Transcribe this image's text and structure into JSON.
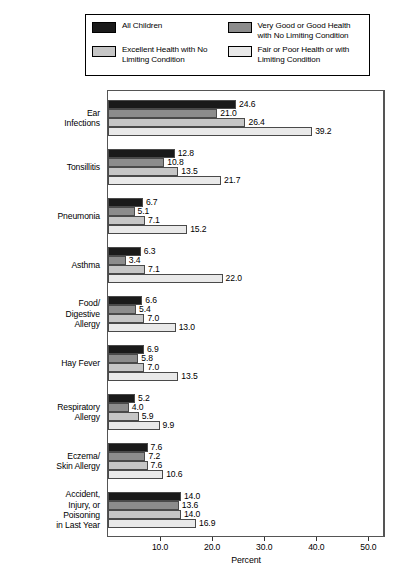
{
  "chart_data": {
    "type": "bar",
    "orientation": "horizontal",
    "title": "",
    "xlabel": "Percent",
    "ylabel": "",
    "xlim": [
      0.0,
      53.0
    ],
    "xticks": [
      "10.0",
      "20.0",
      "30.0",
      "40.0",
      "50.0"
    ],
    "xtick_values": [
      10.0,
      20.0,
      30.0,
      40.0,
      50.0
    ],
    "grid": false,
    "legend_position": "top",
    "categories": [
      "Ear\nInfections",
      "Tonsillitis",
      "Pneumonia",
      "Asthma",
      "Food/\nDigestive\nAllergy",
      "Hay Fever",
      "Respiratory\nAllergy",
      "Eczema/\nSkin Allergy",
      "Accident,\nInjury, or\nPoisoning\nin Last Year"
    ],
    "series": [
      {
        "name": "All Children",
        "color": "#1a1a1a",
        "values": [
          24.6,
          12.8,
          6.7,
          6.3,
          6.6,
          6.9,
          5.2,
          7.6,
          14.0
        ]
      },
      {
        "name": "Very Good or Good Health with No Limiting Condition",
        "color": "#8c8c8c",
        "values": [
          21.0,
          10.8,
          5.1,
          3.4,
          5.4,
          5.8,
          4.0,
          7.2,
          13.6
        ]
      },
      {
        "name": "Excellent Health with No Limiting Condition",
        "color": "#c6c6c6",
        "values": [
          26.4,
          13.5,
          7.1,
          7.1,
          7.0,
          7.0,
          5.9,
          7.6,
          14.0
        ]
      },
      {
        "name": "Fair or Poor Health or with Limiting Condition",
        "color": "#e9e9e9",
        "values": [
          39.2,
          21.7,
          15.2,
          22.0,
          13.0,
          13.5,
          9.9,
          10.6,
          16.9
        ]
      }
    ]
  },
  "legend": {
    "items": [
      {
        "label": "All Children",
        "color": "#1a1a1a",
        "icon": "legend-swatch-icon"
      },
      {
        "label": "Very Good or Good Health with No Limiting Condition",
        "color": "#8c8c8c",
        "icon": "legend-swatch-icon"
      },
      {
        "label": "Excellent Health with No Limiting Condition",
        "color": "#c6c6c6",
        "icon": "legend-swatch-icon"
      },
      {
        "label": "Fair or Poor Health or with Limiting Condition",
        "color": "#e9e9e9",
        "icon": "legend-swatch-icon"
      }
    ]
  },
  "axis": {
    "xlabel": "Percent"
  }
}
